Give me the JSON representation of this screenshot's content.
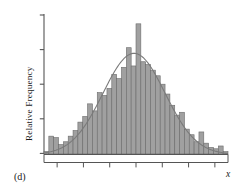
{
  "figure": {
    "panel_label": "(d)",
    "y_axis_label": "Relative Frequency",
    "x_axis_label": "x"
  },
  "chart_data": {
    "type": "bar",
    "title": "",
    "subtitle": "",
    "xlabel": "x",
    "ylabel": "Relative Frequency",
    "panel": "(d)",
    "grid": false,
    "legend": "none",
    "x_tick_labels": [],
    "y_tick_labels": [],
    "n_y_ticks": 5,
    "n_x_major_ticks": 7,
    "xlim": [
      0,
      38
    ],
    "ylim": [
      0,
      1
    ],
    "categories": [
      "b1",
      "b2",
      "b3",
      "b4",
      "b5",
      "b6",
      "b7",
      "b8",
      "b9",
      "b10",
      "b11",
      "b12",
      "b13",
      "b14",
      "b15",
      "b16",
      "b17",
      "b18",
      "b19",
      "b20",
      "b21",
      "b22",
      "b23",
      "b24",
      "b25",
      "b26",
      "b27",
      "b28",
      "b29",
      "b30",
      "b31",
      "b32",
      "b33",
      "b34",
      "b35",
      "b36",
      "b37",
      "b38"
    ],
    "values": [
      0.02,
      0.13,
      0.12,
      0.07,
      0.09,
      0.13,
      0.17,
      0.23,
      0.27,
      0.36,
      0.31,
      0.44,
      0.42,
      0.47,
      0.57,
      0.54,
      0.62,
      0.76,
      0.63,
      0.93,
      0.66,
      0.64,
      0.6,
      0.56,
      0.5,
      0.43,
      0.35,
      0.28,
      0.3,
      0.18,
      0.14,
      0.09,
      0.16,
      0.08,
      0.05,
      0.04,
      0.06,
      0.02
    ],
    "bar_fill_color": "#a0a0a0",
    "bar_edge_color": "#6b6b6b",
    "axis_color": "#555555",
    "overlay": {
      "type": "line",
      "name": "normal density curve",
      "color": "#7a7a7a",
      "peak_value": 0.72,
      "mean_index": 18.6,
      "sd_index": 6.4
    }
  }
}
